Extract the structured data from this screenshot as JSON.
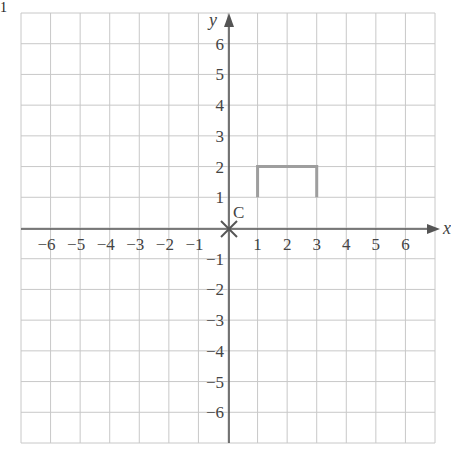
{
  "figure": {
    "corner_label": "1",
    "x_axis_label": "x",
    "y_axis_label": "y",
    "origin_point_label": "C",
    "x_ticks": [
      "−6",
      "−5",
      "−4",
      "−3",
      "−2",
      "−1",
      "1",
      "2",
      "3",
      "4",
      "5",
      "6"
    ],
    "y_ticks": [
      "6",
      "5",
      "4",
      "3",
      "2",
      "1",
      "−1",
      "−2",
      "−3",
      "−4",
      "−5",
      "−6"
    ],
    "grid": {
      "xmin": -7,
      "xmax": 7,
      "ymin": -7,
      "ymax": 7
    },
    "colors": {
      "grid": "#c8c8c8",
      "axes": "#555555",
      "shape": "#9e9e9e"
    }
  },
  "chart_data": {
    "type": "diagram",
    "title": "",
    "xlabel": "x",
    "ylabel": "y",
    "xlim": [
      -7,
      7
    ],
    "ylim": [
      -7,
      7
    ],
    "grid": true,
    "points": [
      {
        "label": "C",
        "x": 0,
        "y": 0,
        "marker": "cross"
      }
    ],
    "polyline": [
      [
        1,
        1
      ],
      [
        1,
        2
      ],
      [
        3,
        2
      ],
      [
        3,
        1
      ]
    ]
  }
}
